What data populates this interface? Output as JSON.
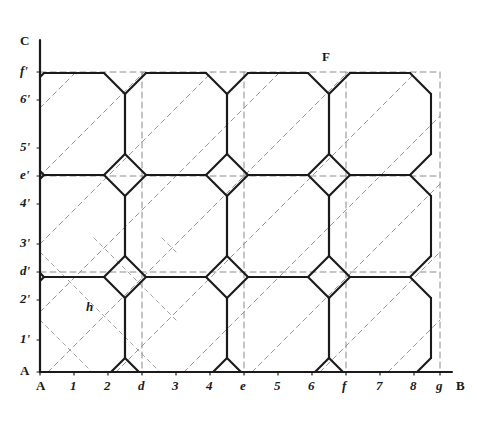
{
  "figure": {
    "kind": "geometric-construction",
    "title_visible": false,
    "background_color": "#ffffff",
    "solid_line_color": "#1a1a1a",
    "dashed_line_color": "#8a8a8a",
    "axis_line_color": "#1a1a1a"
  },
  "axes": {
    "vertical_axis": {
      "name": "AC",
      "origin_label": "A",
      "top_label": "C",
      "x_px": 40,
      "top_px": 40,
      "bottom_px": 372
    },
    "horizontal_axis": {
      "name": "AB",
      "origin_label": "A",
      "right_label": "B",
      "y_px": 372,
      "left_px": 40,
      "right_px": 452
    }
  },
  "x_ticks": [
    {
      "label": "A",
      "x_px": 40,
      "style": "roman"
    },
    {
      "label": "1",
      "x_px": 74,
      "style": "italic"
    },
    {
      "label": "2",
      "x_px": 108,
      "style": "italic"
    },
    {
      "label": "d",
      "x_px": 142,
      "style": "italic"
    },
    {
      "label": "3",
      "x_px": 176,
      "style": "italic"
    },
    {
      "label": "4",
      "x_px": 210,
      "style": "italic"
    },
    {
      "label": "e",
      "x_px": 244,
      "style": "italic"
    },
    {
      "label": "5",
      "x_px": 278,
      "style": "italic"
    },
    {
      "label": "6",
      "x_px": 312,
      "style": "italic"
    },
    {
      "label": "f",
      "x_px": 346,
      "style": "italic"
    },
    {
      "label": "7",
      "x_px": 380,
      "style": "italic"
    },
    {
      "label": "8",
      "x_px": 414,
      "style": "italic"
    },
    {
      "label": "g",
      "x_px": 440,
      "style": "italic"
    },
    {
      "label": "B",
      "x_px": 460,
      "style": "roman"
    }
  ],
  "y_ticks": [
    {
      "label": "C",
      "y_px": 42,
      "style": "roman"
    },
    {
      "label": "f'",
      "y_px": 72,
      "style": "italic"
    },
    {
      "label": "6'",
      "y_px": 100,
      "style": "italic"
    },
    {
      "label": "5'",
      "y_px": 148,
      "style": "italic"
    },
    {
      "label": "e'",
      "y_px": 176,
      "style": "italic"
    },
    {
      "label": "4'",
      "y_px": 204,
      "style": "italic"
    },
    {
      "label": "3'",
      "y_px": 244,
      "style": "italic"
    },
    {
      "label": "d'",
      "y_px": 272,
      "style": "italic"
    },
    {
      "label": "2'",
      "y_px": 300,
      "style": "italic"
    },
    {
      "label": "1'",
      "y_px": 340,
      "style": "italic"
    },
    {
      "label": "A",
      "y_px": 372,
      "style": "roman"
    }
  ],
  "point_labels": [
    {
      "name": "F",
      "text": "F",
      "x_px": 322,
      "y_px": 50,
      "style": "roman"
    },
    {
      "name": "h",
      "text": "h",
      "x_px": 86,
      "y_px": 300,
      "style": "italic"
    }
  ],
  "grid": {
    "vertical_dashed_x": [
      142,
      244,
      346,
      440
    ],
    "horizontal_dashed_y": [
      72,
      176,
      272
    ],
    "module_px": 34
  },
  "pattern": {
    "description": "Tessellation of regular octagons separated by small squares, with dashed 45-degree construction diagonals running through the field.",
    "octagon_centers": [
      [
        74,
        124
      ],
      [
        176,
        124
      ],
      [
        278,
        124
      ],
      [
        380,
        124
      ],
      [
        74,
        226
      ],
      [
        176,
        226
      ],
      [
        278,
        226
      ],
      [
        380,
        226
      ],
      [
        74,
        328
      ],
      [
        176,
        328
      ],
      [
        278,
        328
      ],
      [
        380,
        328
      ]
    ],
    "octagon_half_width_px": 51,
    "octagon_cut_px": 21,
    "square_centers": [
      [
        142,
        72
      ],
      [
        244,
        72
      ],
      [
        346,
        72
      ],
      [
        440,
        72
      ],
      [
        142,
        176
      ],
      [
        244,
        176
      ],
      [
        346,
        176
      ],
      [
        440,
        176
      ],
      [
        142,
        272
      ],
      [
        244,
        272
      ],
      [
        346,
        272
      ],
      [
        440,
        272
      ]
    ]
  }
}
